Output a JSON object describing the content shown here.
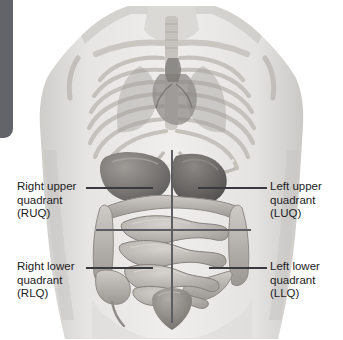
{
  "figure": {
    "palette": {
      "background": "#ffffff",
      "edge_tab": "#63636a",
      "divider_line": "#5d5d62",
      "leader_line": "#3a3a3e",
      "label_text": "#1c1c1e",
      "skin_light": "#e3e2e0",
      "skin_mid": "#c9c7c4",
      "bone_light": "#d8d6d2",
      "bone_mid": "#b6b3ae",
      "organ_dark": "#6f6d6b",
      "organ_mid": "#9e9b97",
      "organ_light": "#c4c1bd"
    }
  },
  "edge_tab": {
    "name": "page-edge-tab"
  },
  "dividers": {
    "vertical": {
      "label": "midsagittal-line"
    },
    "horizontal": {
      "label": "transumbilical-line"
    }
  },
  "labels": {
    "ruq": {
      "line1": "Right upper",
      "line2": "quadrant",
      "line3": "(RUQ)",
      "abbr": "RUQ"
    },
    "luq": {
      "line1": "Left upper",
      "line2": "quadrant",
      "line3": "(LUQ)",
      "abbr": "LUQ"
    },
    "rlq": {
      "line1": "Right lower",
      "line2": "quadrant",
      "line3": "(RLQ)",
      "abbr": "RLQ"
    },
    "llq": {
      "line1": "Left lower",
      "line2": "quadrant",
      "line3": "(LLQ)",
      "abbr": "LLQ"
    }
  },
  "anatomy": {
    "structures": [
      "clavicle",
      "sternum",
      "ribcage",
      "vertebral column",
      "lungs",
      "heart",
      "diaphragm",
      "liver",
      "stomach",
      "small intestine",
      "ascending colon",
      "transverse colon",
      "descending colon",
      "cecum",
      "appendix",
      "urinary bladder"
    ]
  }
}
